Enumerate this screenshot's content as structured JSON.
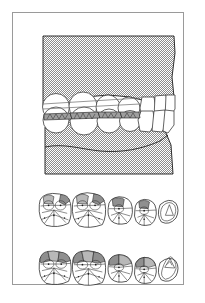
{
  "figure": {
    "panel_count": 3,
    "frame": {
      "stroke": "#9a9a9a",
      "background": "#ffffff"
    }
  },
  "colors": {
    "outline": "#1a1a1a",
    "thin_outline": "#3c3c3c",
    "bone_hatch": "#8c8c8c",
    "bone_hatch_bg": "#ffffff",
    "wear_facet_light": "#b8b8b8",
    "wear_facet_dark": "#8f8f8f",
    "occlusal_contact": "#9e9e9e",
    "frame_stroke": "#9a9a9a",
    "page_background": "#ffffff"
  },
  "panels": [
    {
      "name": "lateral-occlusion-view",
      "label": "Lateral view of teeth in occlusion",
      "position": {
        "x": 29,
        "y": 22,
        "width": 134,
        "height": 140
      },
      "regions": [
        {
          "name": "maxilla-bone",
          "label": "Upper jaw bone",
          "fill": "hatch"
        },
        {
          "name": "mandible-bone",
          "label": "Lower jaw bone",
          "fill": "hatch"
        },
        {
          "name": "upper-teeth-row",
          "label": "Maxillary teeth",
          "count": 7
        },
        {
          "name": "lower-teeth-row",
          "label": "Mandibular teeth",
          "count": 7
        },
        {
          "name": "occlusal-contact-band",
          "label": "Occlusal contact band",
          "fill": "gray"
        }
      ]
    },
    {
      "name": "occlusal-view-upper",
      "label": "Occlusal view — first arch",
      "position": {
        "x": 21,
        "y": 172,
        "width": 146,
        "height": 54
      },
      "teeth": [
        {
          "name": "molar-1",
          "type": "molar",
          "cx": 30,
          "cy": 27,
          "rx": 25,
          "ry": 24,
          "facets": 2,
          "facet_size": "small"
        },
        {
          "name": "molar-2",
          "type": "molar",
          "cx": 80,
          "cy": 27,
          "rx": 26,
          "ry": 25,
          "facets": 2,
          "facet_size": "small"
        },
        {
          "name": "premolar-1",
          "type": "premolar",
          "cx": 124,
          "cy": 31,
          "rx": 18,
          "ry": 19,
          "facets": 1,
          "facet_size": "small"
        },
        {
          "name": "premolar-2",
          "type": "premolar",
          "cx": 160,
          "cy": 33,
          "rx": 16,
          "ry": 17,
          "facets": 1,
          "facet_size": "small"
        },
        {
          "name": "canine",
          "type": "canine",
          "cx": 196,
          "cy": 30,
          "rx": 19,
          "ry": 19,
          "facets": 0,
          "facet_size": "none"
        }
      ]
    },
    {
      "name": "occlusal-view-lower",
      "label": "Occlusal view — second arch",
      "position": {
        "x": 21,
        "y": 229,
        "width": 146,
        "height": 56
      },
      "teeth": [
        {
          "name": "molar-1",
          "type": "molar",
          "cx": 30,
          "cy": 28,
          "rx": 25,
          "ry": 24,
          "facets": 3,
          "facet_size": "large"
        },
        {
          "name": "molar-2",
          "type": "molar",
          "cx": 80,
          "cy": 28,
          "rx": 26,
          "ry": 25,
          "facets": 3,
          "facet_size": "large"
        },
        {
          "name": "premolar-1",
          "type": "premolar",
          "cx": 124,
          "cy": 32,
          "rx": 18,
          "ry": 19,
          "facets": 2,
          "facet_size": "large"
        },
        {
          "name": "premolar-2",
          "type": "premolar",
          "cx": 160,
          "cy": 34,
          "rx": 16,
          "ry": 17,
          "facets": 2,
          "facet_size": "large"
        },
        {
          "name": "canine",
          "type": "canine",
          "cx": 196,
          "cy": 31,
          "rx": 19,
          "ry": 19,
          "facets": 0,
          "facet_size": "none"
        }
      ]
    }
  ]
}
